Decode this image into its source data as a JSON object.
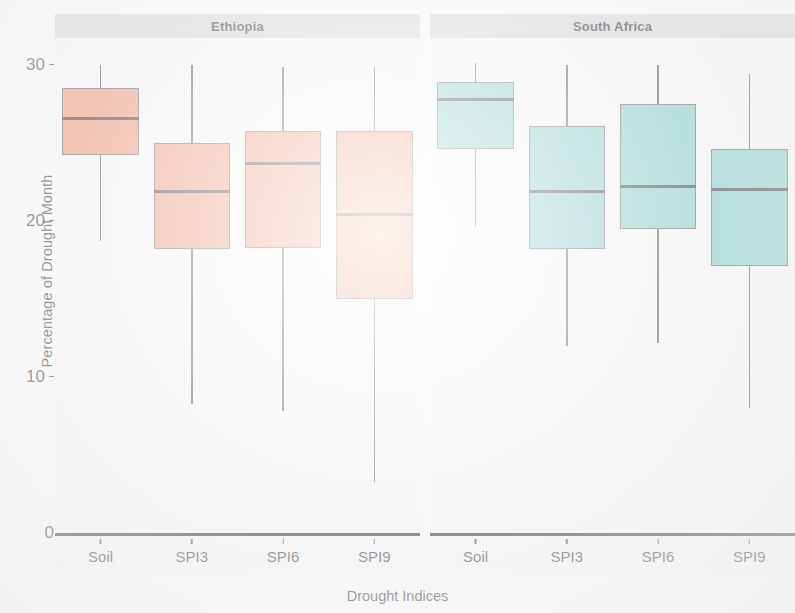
{
  "chart_data": {
    "type": "box",
    "title": "",
    "xlabel": "Drought Indices",
    "ylabel": "Percentage of Drought Month",
    "ylim": [
      0,
      31
    ],
    "yticks": [
      0,
      10,
      20,
      30
    ],
    "ytick_labels": [
      "0",
      "10",
      "20",
      "30"
    ],
    "categories": [
      "Soil",
      "SPI3",
      "SPI6",
      "SPI9"
    ],
    "grid": false,
    "legend": "none",
    "facet_labels": [
      "Ethiopia",
      "South Africa"
    ],
    "colors": {
      "ethiopia_fill": "#F08763",
      "south_africa_fill": "#6FC5BE",
      "box_outline": "#4a4a4a",
      "median_line": "#171717",
      "strip_background": "#d2d2d2",
      "panel_background": "#f7f7f7",
      "axis_line": "#141414"
    },
    "panels": [
      {
        "name": "Ethiopia",
        "fill": "#F08763",
        "boxes": [
          {
            "category": "Soil",
            "whisker_low": 18.7,
            "q1": 24.2,
            "median": 26.6,
            "q3": 28.5,
            "whisker_high": 30.0
          },
          {
            "category": "SPI3",
            "whisker_low": 8.3,
            "q1": 18.2,
            "median": 21.9,
            "q3": 25.0,
            "whisker_high": 30.0
          },
          {
            "category": "SPI6",
            "whisker_low": 7.8,
            "q1": 18.3,
            "median": 23.7,
            "q3": 25.8,
            "whisker_high": 29.9
          },
          {
            "category": "SPI9",
            "whisker_low": 3.3,
            "q1": 15.0,
            "median": 20.4,
            "q3": 25.8,
            "whisker_high": 29.9
          }
        ]
      },
      {
        "name": "South Africa",
        "fill": "#6FC5BE",
        "boxes": [
          {
            "category": "Soil",
            "whisker_low": 19.6,
            "q1": 24.6,
            "median": 27.8,
            "q3": 28.9,
            "whisker_high": 30.1
          },
          {
            "category": "SPI3",
            "whisker_low": 12.0,
            "q1": 18.2,
            "median": 21.9,
            "q3": 26.1,
            "whisker_high": 30.0
          },
          {
            "category": "SPI6",
            "whisker_low": 12.2,
            "q1": 19.5,
            "median": 22.2,
            "q3": 27.5,
            "whisker_high": 30.0
          },
          {
            "category": "SPI9",
            "whisker_low": 8.0,
            "q1": 17.1,
            "median": 22.0,
            "q3": 24.6,
            "whisker_high": 29.4
          }
        ]
      }
    ]
  }
}
